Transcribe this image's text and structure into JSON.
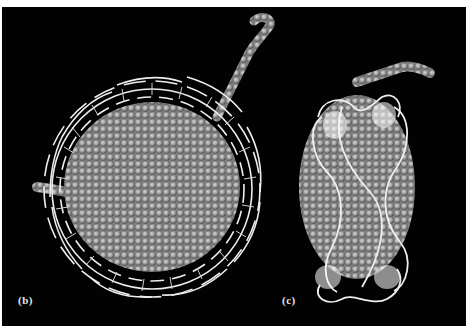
{
  "figure": {
    "background_color": "#020202",
    "frame_color": "#ffffff",
    "protein_color": "#9a9a9a",
    "dna_color": "#eeeeee",
    "panels": [
      {
        "id": "b",
        "label": "(b)",
        "view": "top view: histone octamer disc wrapped by DNA superhelix, with histone tail extending upward"
      },
      {
        "id": "c",
        "label": "(c)",
        "view": "side view: two DNA gyres wrapping histone core"
      }
    ]
  }
}
